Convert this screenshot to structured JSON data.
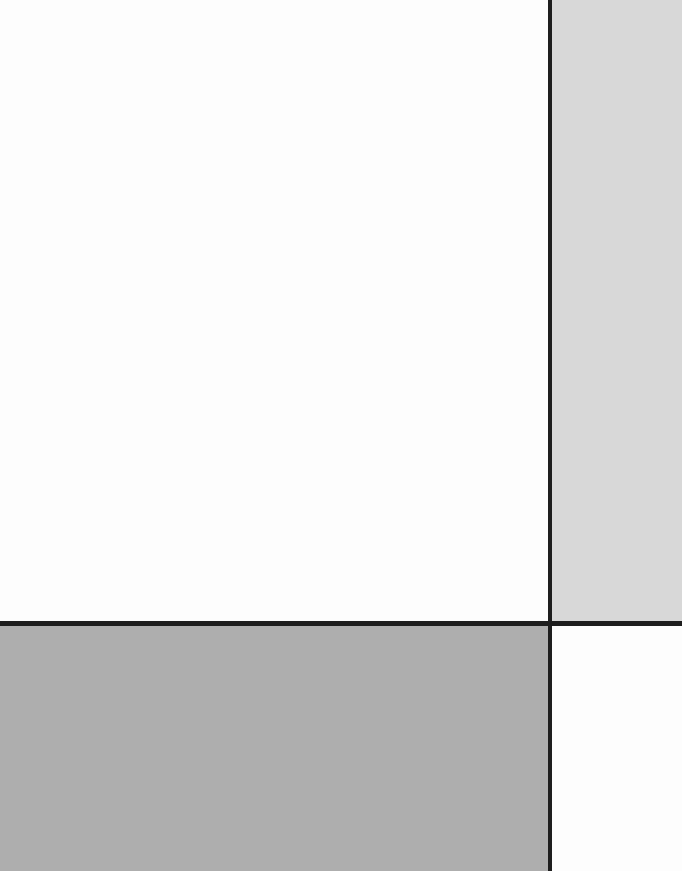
{
  "composition": {
    "style": "mondrian-grid",
    "colors": {
      "white": "#fdfdfd",
      "light_gray": "#d8d8d8",
      "mid_gray": "#aeaeae",
      "line": "#1e1e1e"
    },
    "blocks": [
      {
        "name": "top-left-white",
        "x": 0,
        "y": 0,
        "w": 549,
        "h": 622,
        "color": "#fdfdfd"
      },
      {
        "name": "top-right-gray",
        "x": 552,
        "y": 0,
        "w": 130,
        "h": 622,
        "color": "#d8d8d8"
      },
      {
        "name": "bottom-left-gray",
        "x": 0,
        "y": 626,
        "w": 549,
        "h": 245,
        "color": "#aeaeae"
      },
      {
        "name": "bottom-right-white",
        "x": 552,
        "y": 626,
        "w": 130,
        "h": 245,
        "color": "#fdfdfd"
      }
    ]
  }
}
